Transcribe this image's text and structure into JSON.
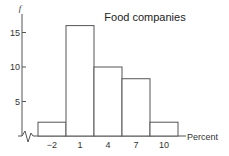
{
  "chart_data": {
    "type": "bar",
    "title": "Food companies",
    "xlabel": "Percent",
    "ylabel": "f",
    "categories": [
      "-2",
      "1",
      "4",
      "7",
      "10"
    ],
    "bins": [
      [
        -3.5,
        -0.5
      ],
      [
        -0.5,
        2.5
      ],
      [
        2.5,
        5.5
      ],
      [
        5.5,
        8.5
      ],
      [
        8.5,
        11.5
      ]
    ],
    "values": [
      2,
      16,
      10,
      8.3,
      2
    ],
    "xticks": [
      -2,
      1,
      4,
      7,
      10
    ],
    "xtick_labels": [
      "−2",
      "1",
      "4",
      "7",
      "10"
    ],
    "yticks": [
      5,
      10,
      15
    ],
    "ytick_labels": [
      "5",
      "10",
      "15"
    ],
    "xlim": [
      -5.5,
      12
    ],
    "ylim": [
      0,
      16
    ],
    "grid": false,
    "axis_break": "x-axis near origin",
    "legend": "none"
  }
}
